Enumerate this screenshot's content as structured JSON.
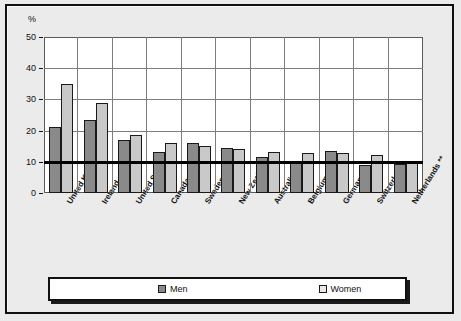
{
  "chart_data": {
    "type": "bar",
    "title": "",
    "xlabel": "",
    "ylabel": "%",
    "ylim": [
      0,
      50
    ],
    "yticks": [
      0,
      10,
      20,
      30,
      40,
      50
    ],
    "grid": true,
    "legend_position": "bottom",
    "reference_line": 10,
    "categories": [
      "United Kingdom",
      "Ireland",
      "United States",
      "Canada",
      "Sweden **",
      "New Zealand",
      "Australia **",
      "Belgium *",
      "Germany",
      "Switzerland",
      "Netherlands **"
    ],
    "series": [
      {
        "name": "Men",
        "color": "#8a8a8a",
        "values": [
          21.2,
          23.5,
          17.1,
          13.1,
          16.0,
          14.5,
          11.5,
          10.0,
          13.5,
          9.0,
          9.3
        ]
      },
      {
        "name": "Women",
        "color": "#c9c9c9",
        "values": [
          34.8,
          29.0,
          18.7,
          16.0,
          15.2,
          14.1,
          13.0,
          12.9,
          12.7,
          12.3,
          10.3
        ]
      }
    ]
  },
  "legend": {
    "men_label": "Men",
    "women_label": "Women"
  }
}
